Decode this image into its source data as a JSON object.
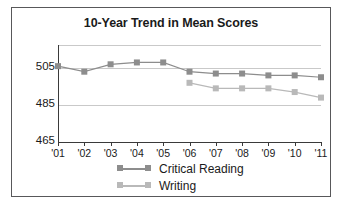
{
  "chart_data": {
    "type": "line",
    "title": "10-Year Trend in Mean Scores",
    "xlabel": "",
    "ylabel": "",
    "categories": [
      "'01",
      "'02",
      "'03",
      "'04",
      "'05",
      "'06",
      "'07",
      "'08",
      "'09",
      "'10",
      "'11"
    ],
    "ylim": [
      465,
      511
    ],
    "yticks": [
      465,
      485,
      505
    ],
    "grid": true,
    "legend_position": "bottom",
    "series": [
      {
        "name": "Critical Reading",
        "color": "#8d8d8d",
        "values": [
          506,
          503,
          507,
          508,
          508,
          503,
          502,
          502,
          501,
          501,
          500
        ]
      },
      {
        "name": "Writing",
        "color": "#b9b9b9",
        "values": [
          null,
          null,
          null,
          null,
          null,
          497,
          494,
          494,
          494,
          492,
          489
        ]
      }
    ]
  },
  "legend": {
    "items": [
      {
        "label": "Critical Reading"
      },
      {
        "label": "Writing"
      }
    ]
  },
  "colors": {
    "frame": "#58585a",
    "axis": "#3a3a3a",
    "grid": "#c9c9c9",
    "text": "#1a1a1a"
  }
}
